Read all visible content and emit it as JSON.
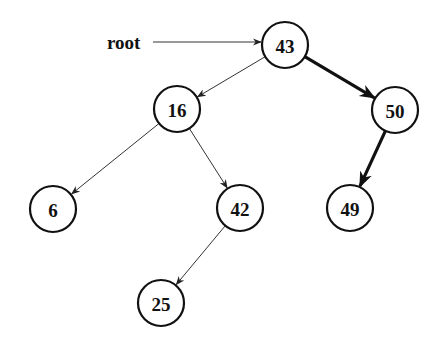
{
  "diagram": {
    "type": "binary-search-tree",
    "root_pointer": {
      "label": "root",
      "x": 107,
      "y": 49,
      "arrow_from": [
        153,
        42
      ],
      "target": "n43"
    },
    "node_radius": 23,
    "nodes": [
      {
        "id": "n43",
        "value": "43",
        "x": 285,
        "y": 45,
        "role": "root"
      },
      {
        "id": "n16",
        "value": "16",
        "x": 177,
        "y": 109,
        "role": "left-child-of-43"
      },
      {
        "id": "n50",
        "value": "50",
        "x": 395,
        "y": 110,
        "role": "right-child-of-43"
      },
      {
        "id": "n6",
        "value": "6",
        "x": 53,
        "y": 209,
        "role": "left-child-of-16"
      },
      {
        "id": "n42",
        "value": "42",
        "x": 240,
        "y": 208,
        "role": "right-child-of-16"
      },
      {
        "id": "n49",
        "value": "49",
        "x": 350,
        "y": 208,
        "role": "left-child-of-50"
      },
      {
        "id": "n25",
        "value": "25",
        "x": 161,
        "y": 303,
        "role": "left-child-of-42"
      }
    ],
    "edges": [
      {
        "from": "n43",
        "to": "n16",
        "style": "thin"
      },
      {
        "from": "n43",
        "to": "n50",
        "style": "thick"
      },
      {
        "from": "n16",
        "to": "n6",
        "style": "thin"
      },
      {
        "from": "n16",
        "to": "n42",
        "style": "thin"
      },
      {
        "from": "n42",
        "to": "n25",
        "style": "thin"
      },
      {
        "from": "n50",
        "to": "n49",
        "style": "thick"
      }
    ],
    "highlighted_path": [
      "43",
      "50",
      "49"
    ],
    "colors": {
      "stroke": "#111111",
      "thin_edge": "#333333",
      "background": "#ffffff",
      "node_fill": "#ffffff"
    }
  }
}
